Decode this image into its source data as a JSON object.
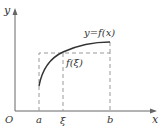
{
  "diagram": {
    "axes": {
      "x_label": "x",
      "y_label": "y",
      "origin_label": "O"
    },
    "curve_label": "y=f(x)",
    "point_labels": {
      "a": "a",
      "xi": "ξ",
      "b": "b"
    },
    "value_label": "f(ξ)",
    "colors": {
      "axis": "#666666",
      "curve": "#333333",
      "dashed": "#999999"
    }
  }
}
